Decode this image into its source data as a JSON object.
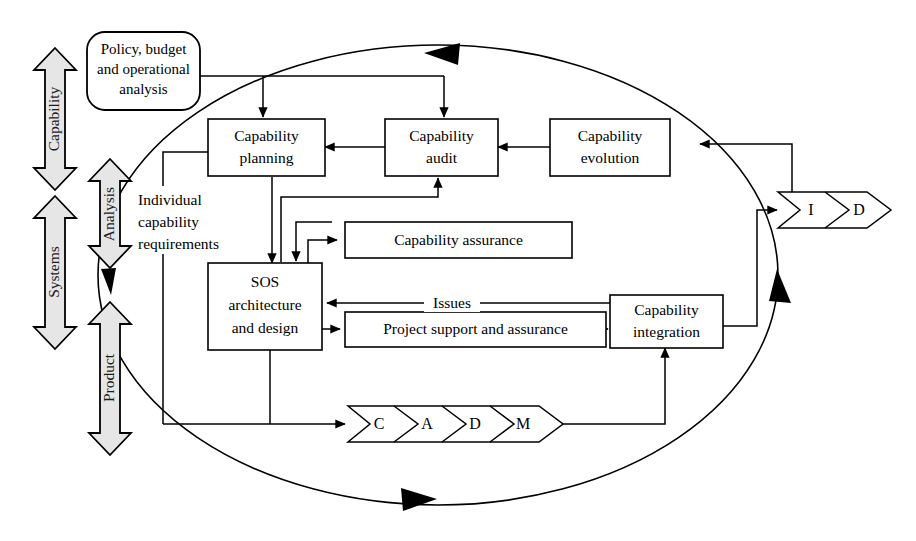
{
  "diagram": {
    "canvas": {
      "width": 916,
      "height": 541
    },
    "colors": {
      "stroke": "#000000",
      "background": "#ffffff",
      "block_arrow_fill": "#e6e6e6"
    }
  },
  "axes": {
    "left_column": [
      {
        "id": "capability",
        "label": "Capability"
      },
      {
        "id": "systems",
        "label": "Systems"
      }
    ],
    "inner_column": [
      {
        "id": "analysis",
        "label": "Analysis"
      },
      {
        "id": "product",
        "label": "Product"
      }
    ]
  },
  "nodes": {
    "policy": {
      "label_line1": "Policy, budget",
      "label_line2": "and operational",
      "label_line3": "analysis"
    },
    "capability_planning": {
      "label_line1": "Capability",
      "label_line2": "planning"
    },
    "capability_audit": {
      "label_line1": "Capability",
      "label_line2": "audit"
    },
    "capability_evolution": {
      "label_line1": "Capability",
      "label_line2": "evolution"
    },
    "capability_assurance": {
      "label": "Capability assurance"
    },
    "sos_architecture": {
      "label_line1": "SOS",
      "label_line2": "architecture",
      "label_line3": "and design"
    },
    "project_support": {
      "label": "Project support and assurance"
    },
    "capability_integration": {
      "label_line1": "Capability",
      "label_line2": "integration"
    }
  },
  "free_labels": {
    "individual_capability_requirements": {
      "line1": "Individual",
      "line2": "capability",
      "line3": "requirements"
    }
  },
  "edge_labels": {
    "issues": "Issues"
  },
  "chevron_bars": {
    "cadm": {
      "segments": [
        "C",
        "A",
        "D",
        "M"
      ]
    },
    "id": {
      "segments": [
        "I",
        "D"
      ]
    }
  }
}
